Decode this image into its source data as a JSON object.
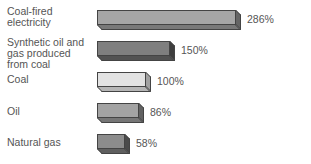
{
  "chart_data": {
    "type": "bar",
    "orientation": "horizontal",
    "title": "",
    "xlabel": "",
    "ylabel": "",
    "categories": [
      "Coal-fired electricity",
      "Synthetic oil and gas produced from coal",
      "Coal",
      "Oil",
      "Natural gas"
    ],
    "values": [
      286,
      150,
      100,
      86,
      58
    ],
    "value_labels": [
      "286%",
      "150%",
      "100%",
      "86%",
      "58%"
    ],
    "colors": [
      "#a6a6a6",
      "#7f7f7f",
      "#e2e2e2",
      "#a3a3a3",
      "#8c8c8c"
    ],
    "grid": false,
    "legend": null
  },
  "rows": [
    {
      "label_lines": [
        "Coal-fired",
        "electricity"
      ],
      "value": "286%"
    },
    {
      "label_lines": [
        "Synthetic oil and",
        "gas produced",
        "from coal"
      ],
      "value": "150%"
    },
    {
      "label_lines": [
        "Coal"
      ],
      "value": "100%"
    },
    {
      "label_lines": [
        "Oil"
      ],
      "value": "86%"
    },
    {
      "label_lines": [
        "Natural gas"
      ],
      "value": "58%"
    }
  ]
}
